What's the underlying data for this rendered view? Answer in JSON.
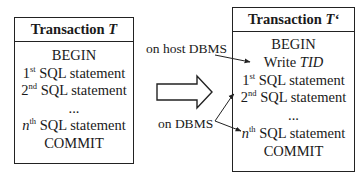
{
  "left_box": {
    "title": "Transaction ",
    "title_var": "T",
    "lines": [
      "BEGIN",
      "SQL statement",
      "SQL statement",
      "...",
      "SQL statement",
      "COMMIT"
    ],
    "ordinals": {
      "first": "1",
      "first_sup": "st",
      "second": "2",
      "second_sup": "nd",
      "nth": "n",
      "nth_sup": "th"
    }
  },
  "right_box": {
    "title": "Transaction ",
    "title_var": "T‘",
    "lines": [
      "BEGIN",
      "Write ",
      "SQL statement",
      "SQL statement",
      "...",
      "SQL statement",
      "COMMIT"
    ],
    "write_var": "TID",
    "ordinals": {
      "first": "1",
      "first_sup": "st",
      "second": "2",
      "second_sup": "nd",
      "nth": "n",
      "nth_sup": "th"
    }
  },
  "annotations": {
    "host": "on host DBMS",
    "dbms": "on DBMS"
  },
  "colors": {
    "line": "#222222",
    "background": "#ffffff"
  }
}
